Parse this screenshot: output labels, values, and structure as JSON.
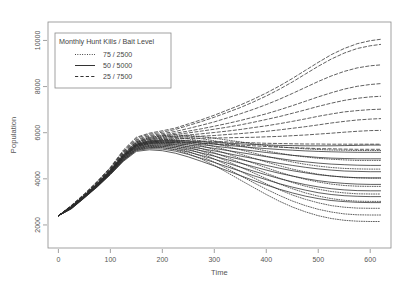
{
  "chart_data": {
    "type": "line",
    "title": "",
    "xlabel": "Time",
    "ylabel": "Population",
    "xlim": [
      -20,
      640
    ],
    "ylim": [
      1000,
      10800
    ],
    "xticks": [
      0,
      100,
      200,
      300,
      400,
      500,
      600
    ],
    "yticks": [
      2000,
      4000,
      6000,
      8000,
      10000
    ],
    "xtick_labels": [
      "0",
      "100",
      "200",
      "300",
      "400",
      "500",
      "600"
    ],
    "ytick_labels": [
      "2000",
      "4000",
      "6000",
      "8000",
      "10000"
    ],
    "grid": false,
    "frame": true,
    "legend": {
      "position": "top-left",
      "title": "Monthly Hunt Kills / Bait Level",
      "entries": [
        {
          "label": "75 / 2500",
          "style": "dotted",
          "color": "#333333"
        },
        {
          "label": "50 / 5000",
          "style": "solid",
          "color": "#333333"
        },
        {
          "label": "25 / 7500",
          "style": "dashed",
          "color": "#333333"
        }
      ]
    },
    "x": [
      0,
      25,
      50,
      75,
      100,
      125,
      150,
      175,
      200,
      225,
      250,
      275,
      300,
      325,
      350,
      375,
      400,
      425,
      450,
      475,
      500,
      525,
      550,
      575,
      600,
      620
    ],
    "series": [
      {
        "name": "d1",
        "style": "dashed",
        "values": [
          2400,
          2850,
          3350,
          3900,
          4500,
          5250,
          5800,
          5980,
          6080,
          6200,
          6380,
          6560,
          6760,
          6980,
          7200,
          7450,
          7720,
          8020,
          8350,
          8700,
          9050,
          9380,
          9650,
          9860,
          9990,
          10050
        ]
      },
      {
        "name": "d2",
        "style": "dashed",
        "values": [
          2400,
          2840,
          3330,
          3880,
          4480,
          5200,
          5760,
          5930,
          6020,
          6140,
          6310,
          6480,
          6670,
          6880,
          7090,
          7330,
          7590,
          7880,
          8200,
          8540,
          8880,
          9190,
          9450,
          9650,
          9770,
          9830
        ]
      },
      {
        "name": "d3",
        "style": "dashed",
        "values": [
          2400,
          2830,
          3320,
          3860,
          4460,
          5180,
          5700,
          5880,
          5960,
          6050,
          6180,
          6320,
          6470,
          6640,
          6820,
          7010,
          7220,
          7450,
          7700,
          7960,
          8220,
          8460,
          8660,
          8810,
          8900,
          8940
        ]
      },
      {
        "name": "d4",
        "style": "dashed",
        "values": [
          2400,
          2820,
          3300,
          3840,
          4430,
          5140,
          5660,
          5840,
          5910,
          5980,
          6070,
          6170,
          6280,
          6400,
          6530,
          6670,
          6820,
          6990,
          7170,
          7360,
          7550,
          7730,
          7890,
          8010,
          8090,
          8130
        ]
      },
      {
        "name": "d5",
        "style": "dashed",
        "values": [
          2400,
          2810,
          3290,
          3820,
          4410,
          5100,
          5620,
          5790,
          5860,
          5920,
          5990,
          6070,
          6150,
          6240,
          6340,
          6450,
          6570,
          6700,
          6840,
          6990,
          7140,
          7280,
          7400,
          7490,
          7550,
          7580
        ]
      },
      {
        "name": "d6",
        "style": "dashed",
        "values": [
          2400,
          2800,
          3280,
          3800,
          4390,
          5070,
          5580,
          5740,
          5800,
          5850,
          5900,
          5950,
          6010,
          6070,
          6140,
          6220,
          6300,
          6390,
          6490,
          6600,
          6710,
          6810,
          6900,
          6960,
          7000,
          7020
        ]
      },
      {
        "name": "d7",
        "style": "dashed",
        "values": [
          2400,
          2790,
          3270,
          3790,
          4370,
          5040,
          5540,
          5700,
          5750,
          5790,
          5820,
          5850,
          5880,
          5920,
          5960,
          6010,
          6060,
          6120,
          6190,
          6260,
          6340,
          6420,
          6490,
          6550,
          6590,
          6610
        ]
      },
      {
        "name": "d8",
        "style": "dashed",
        "values": [
          2400,
          2780,
          3250,
          3770,
          4350,
          5010,
          5500,
          5650,
          5700,
          5730,
          5750,
          5760,
          5770,
          5780,
          5790,
          5800,
          5820,
          5840,
          5870,
          5900,
          5940,
          5980,
          6020,
          6060,
          6090,
          6100
        ]
      },
      {
        "name": "d9",
        "style": "dashed",
        "values": [
          2400,
          2770,
          3240,
          3760,
          4330,
          4980,
          5460,
          5600,
          5640,
          5650,
          5650,
          5640,
          5620,
          5600,
          5580,
          5560,
          5540,
          5530,
          5520,
          5510,
          5510,
          5500,
          5500,
          5500,
          5500,
          5500
        ]
      },
      {
        "name": "d10",
        "style": "dashed",
        "values": [
          2400,
          2760,
          3230,
          3740,
          4310,
          4950,
          5420,
          5550,
          5580,
          5580,
          5570,
          5550,
          5520,
          5490,
          5460,
          5430,
          5400,
          5370,
          5350,
          5330,
          5310,
          5300,
          5290,
          5280,
          5280,
          5280
        ]
      },
      {
        "name": "s1",
        "style": "solid",
        "values": [
          2400,
          2790,
          3260,
          3780,
          4360,
          5020,
          5500,
          5640,
          5670,
          5660,
          5640,
          5610,
          5580,
          5550,
          5520,
          5490,
          5470,
          5450,
          5440,
          5430,
          5430,
          5430,
          5440,
          5450,
          5460,
          5460
        ]
      },
      {
        "name": "s2",
        "style": "solid",
        "values": [
          2400,
          2780,
          3250,
          3770,
          4340,
          4990,
          5470,
          5600,
          5630,
          5620,
          5590,
          5550,
          5500,
          5450,
          5400,
          5350,
          5310,
          5270,
          5240,
          5210,
          5190,
          5170,
          5160,
          5150,
          5150,
          5150
        ]
      },
      {
        "name": "s3",
        "style": "solid",
        "values": [
          2400,
          2770,
          3240,
          3750,
          4320,
          4960,
          5440,
          5570,
          5590,
          5570,
          5530,
          5480,
          5420,
          5350,
          5280,
          5210,
          5140,
          5080,
          5020,
          4970,
          4930,
          4900,
          4880,
          4870,
          4870,
          4870
        ]
      },
      {
        "name": "s4",
        "style": "solid",
        "values": [
          2400,
          2760,
          3230,
          3740,
          4300,
          4930,
          5410,
          5530,
          5550,
          5520,
          5470,
          5400,
          5320,
          5230,
          5140,
          5050,
          4960,
          4880,
          4800,
          4740,
          4680,
          4640,
          4610,
          4590,
          4580,
          4580
        ]
      },
      {
        "name": "s5",
        "style": "solid",
        "values": [
          2400,
          2750,
          3220,
          3730,
          4280,
          4910,
          5380,
          5500,
          5510,
          5470,
          5400,
          5310,
          5210,
          5100,
          4990,
          4880,
          4770,
          4670,
          4580,
          4500,
          4430,
          4380,
          4340,
          4320,
          4310,
          4310
        ]
      },
      {
        "name": "s6",
        "style": "solid",
        "values": [
          2400,
          2740,
          3210,
          3710,
          4260,
          4880,
          5340,
          5450,
          5460,
          5410,
          5330,
          5220,
          5100,
          4970,
          4840,
          4710,
          4580,
          4460,
          4350,
          4260,
          4180,
          4120,
          4080,
          4050,
          4040,
          4040
        ]
      },
      {
        "name": "s7",
        "style": "solid",
        "values": [
          2400,
          2730,
          3200,
          3700,
          4240,
          4850,
          5300,
          5410,
          5410,
          5350,
          5250,
          5120,
          4980,
          4830,
          4680,
          4530,
          4380,
          4240,
          4120,
          4010,
          3920,
          3850,
          3800,
          3770,
          3760,
          3760
        ]
      },
      {
        "name": "s8",
        "style": "solid",
        "values": [
          2400,
          2720,
          3190,
          3680,
          4220,
          4820,
          5270,
          5360,
          5350,
          5280,
          5160,
          5010,
          4850,
          4680,
          4510,
          4340,
          4170,
          4010,
          3870,
          3750,
          3650,
          3570,
          3520,
          3490,
          3480,
          3480
        ]
      },
      {
        "name": "s9",
        "style": "solid",
        "values": [
          2400,
          2710,
          3180,
          3670,
          4200,
          4790,
          5230,
          5310,
          5290,
          5200,
          5060,
          4890,
          4710,
          4520,
          4330,
          4140,
          3960,
          3790,
          3640,
          3510,
          3400,
          3320,
          3270,
          3240,
          3230,
          3230
        ]
      },
      {
        "name": "s10",
        "style": "solid",
        "values": [
          2400,
          2700,
          3170,
          3650,
          4180,
          4760,
          5190,
          5260,
          5220,
          5110,
          4950,
          4760,
          4560,
          4350,
          4140,
          3930,
          3730,
          3550,
          3390,
          3250,
          3140,
          3060,
          3010,
          2980,
          2970,
          2970
        ]
      },
      {
        "name": "p1",
        "style": "dotted",
        "values": [
          2400,
          2800,
          3280,
          3800,
          4390,
          5070,
          5590,
          5790,
          5880,
          5900,
          5880,
          5830,
          5760,
          5680,
          5600,
          5520,
          5450,
          5390,
          5340,
          5300,
          5270,
          5250,
          5240,
          5230,
          5230,
          5230
        ]
      },
      {
        "name": "p2",
        "style": "dotted",
        "values": [
          2400,
          2790,
          3270,
          3790,
          4370,
          5040,
          5560,
          5750,
          5830,
          5840,
          5810,
          5740,
          5650,
          5540,
          5430,
          5320,
          5210,
          5110,
          5020,
          4950,
          4890,
          4850,
          4820,
          4800,
          4800,
          4800
        ]
      },
      {
        "name": "p3",
        "style": "dotted",
        "values": [
          2400,
          2780,
          3260,
          3770,
          4350,
          5010,
          5520,
          5700,
          5770,
          5770,
          5730,
          5640,
          5530,
          5400,
          5260,
          5120,
          4980,
          4850,
          4730,
          4630,
          4550,
          4490,
          4450,
          4430,
          4420,
          4420
        ]
      },
      {
        "name": "p4",
        "style": "dotted",
        "values": [
          2400,
          2770,
          3250,
          3760,
          4330,
          4980,
          5480,
          5650,
          5710,
          5700,
          5640,
          5540,
          5400,
          5240,
          5070,
          4900,
          4730,
          4570,
          4420,
          4300,
          4200,
          4120,
          4070,
          4040,
          4030,
          4030
        ]
      },
      {
        "name": "p5",
        "style": "dotted",
        "values": [
          2400,
          2760,
          3240,
          3740,
          4310,
          4950,
          5440,
          5600,
          5650,
          5630,
          5560,
          5430,
          5270,
          5080,
          4880,
          4680,
          4480,
          4290,
          4120,
          3980,
          3860,
          3770,
          3710,
          3680,
          3670,
          3670
        ]
      },
      {
        "name": "p6",
        "style": "dotted",
        "values": [
          2400,
          2750,
          3230,
          3730,
          4290,
          4920,
          5400,
          5550,
          5590,
          5560,
          5470,
          5320,
          5130,
          4920,
          4700,
          4470,
          4240,
          4030,
          3840,
          3680,
          3550,
          3450,
          3390,
          3350,
          3340,
          3340
        ]
      },
      {
        "name": "p7",
        "style": "dotted",
        "values": [
          2400,
          2740,
          3220,
          3710,
          4270,
          4890,
          5360,
          5500,
          5530,
          5490,
          5380,
          5210,
          5000,
          4760,
          4510,
          4260,
          4010,
          3780,
          3570,
          3390,
          3250,
          3140,
          3070,
          3030,
          3020,
          3020
        ]
      },
      {
        "name": "p8",
        "style": "dotted",
        "values": [
          2400,
          2730,
          3210,
          3700,
          4250,
          4860,
          5320,
          5450,
          5470,
          5420,
          5290,
          5100,
          4860,
          4600,
          4330,
          4050,
          3780,
          3530,
          3300,
          3110,
          2960,
          2840,
          2770,
          2730,
          2720,
          2720
        ]
      },
      {
        "name": "p9",
        "style": "dotted",
        "values": [
          2400,
          2720,
          3200,
          3680,
          4230,
          4830,
          5280,
          5400,
          5410,
          5340,
          5190,
          4980,
          4720,
          4440,
          4140,
          3840,
          3550,
          3280,
          3040,
          2840,
          2680,
          2560,
          2480,
          2440,
          2430,
          2430
        ]
      },
      {
        "name": "p10",
        "style": "dotted",
        "values": [
          2400,
          2710,
          3190,
          3670,
          4210,
          4800,
          5240,
          5350,
          5350,
          5260,
          5090,
          4860,
          4580,
          4270,
          3950,
          3630,
          3320,
          3030,
          2780,
          2570,
          2400,
          2280,
          2200,
          2160,
          2150,
          2150
        ]
      }
    ]
  }
}
